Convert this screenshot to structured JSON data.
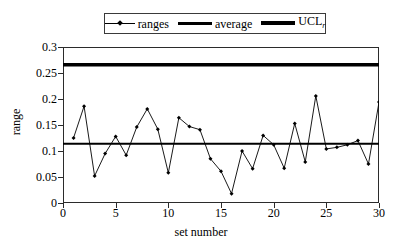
{
  "chart_data": {
    "type": "line",
    "title": "",
    "xlabel": "set number",
    "ylabel": "range",
    "xlim": [
      0,
      30
    ],
    "ylim": [
      0,
      0.3
    ],
    "xticks": [
      0,
      5,
      10,
      15,
      20,
      25,
      30
    ],
    "yticks": [
      "0",
      "0.05",
      "0.1",
      "0.15",
      "0.2",
      "0.25",
      "0.3"
    ],
    "ytick_values": [
      0,
      0.05,
      0.1,
      0.15,
      0.2,
      0.25,
      0.3
    ],
    "grid": false,
    "legend_position": "top-center",
    "x": [
      1,
      2,
      3,
      4,
      5,
      6,
      7,
      8,
      9,
      10,
      11,
      12,
      13,
      14,
      15,
      16,
      17,
      18,
      19,
      20,
      21,
      22,
      23,
      24,
      25,
      26,
      27,
      28,
      29,
      30
    ],
    "series": [
      {
        "name": "ranges",
        "kind": "line-marker",
        "values": [
          0.125,
          0.186,
          0.052,
          0.095,
          0.128,
          0.092,
          0.146,
          0.181,
          0.142,
          0.058,
          0.164,
          0.147,
          0.141,
          0.085,
          0.061,
          0.018,
          0.1,
          0.066,
          0.13,
          0.112,
          0.067,
          0.153,
          0.079,
          0.206,
          0.104,
          0.107,
          0.112,
          0.12,
          0.075,
          0.194
        ]
      },
      {
        "name": "average",
        "kind": "hline",
        "value": 0.114
      },
      {
        "name": "UCL",
        "kind": "hline",
        "value": 0.266
      }
    ],
    "legend": [
      {
        "label": "ranges",
        "sub": "",
        "style": "thin-marker"
      },
      {
        "label": "average",
        "sub": "",
        "style": "medium"
      },
      {
        "label": "UCL",
        "sub": "r",
        "style": "thick"
      }
    ],
    "colors": {
      "line": "#000000",
      "marker": "#000000",
      "average": "#000000",
      "ucl": "#000000",
      "axis": "#2b2b2b",
      "background": "#ffffff"
    }
  }
}
